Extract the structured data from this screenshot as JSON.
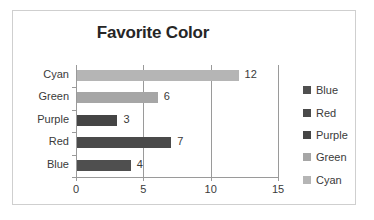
{
  "chart_data": {
    "type": "bar",
    "orientation": "horizontal",
    "title": "Favorite Color",
    "xlabel": "",
    "ylabel": "",
    "categories": [
      "Blue",
      "Red",
      "Purple",
      "Green",
      "Cyan"
    ],
    "values": [
      4,
      7,
      3,
      6,
      12
    ],
    "data_labels": [
      "4",
      "7",
      "3",
      "6",
      "12"
    ],
    "display_order_top_to_bottom": [
      "Cyan",
      "Green",
      "Purple",
      "Red",
      "Blue"
    ],
    "xlim": [
      0,
      15
    ],
    "xticks": [
      0,
      5,
      10,
      15
    ],
    "xtick_labels": [
      "0",
      "5",
      "10",
      "15"
    ],
    "grid": "vertical",
    "legend_position": "right",
    "legend": [
      {
        "label": "Blue",
        "color": "#4f4f4f"
      },
      {
        "label": "Red",
        "color": "#4a4a4a"
      },
      {
        "label": "Purple",
        "color": "#454545"
      },
      {
        "label": "Green",
        "color": "#a6a6a6"
      },
      {
        "label": "Cyan",
        "color": "#b5b5b5"
      }
    ],
    "bars_top_to_bottom": [
      {
        "category": "Cyan",
        "value": 12,
        "label": "12",
        "color": "#b5b5b5"
      },
      {
        "category": "Green",
        "value": 6,
        "label": "6",
        "color": "#a6a6a6"
      },
      {
        "category": "Purple",
        "value": 3,
        "label": "3",
        "color": "#454545"
      },
      {
        "category": "Red",
        "value": 7,
        "label": "7",
        "color": "#4a4a4a"
      },
      {
        "category": "Blue",
        "value": 4,
        "label": "4",
        "color": "#4f4f4f"
      }
    ],
    "colors": {
      "axis": "#9a9a9a",
      "grid": "#9a9a9a",
      "text": "#3a3a3a",
      "title": "#262626",
      "frame": "#cfcfcf",
      "background": "#ffffff"
    }
  }
}
